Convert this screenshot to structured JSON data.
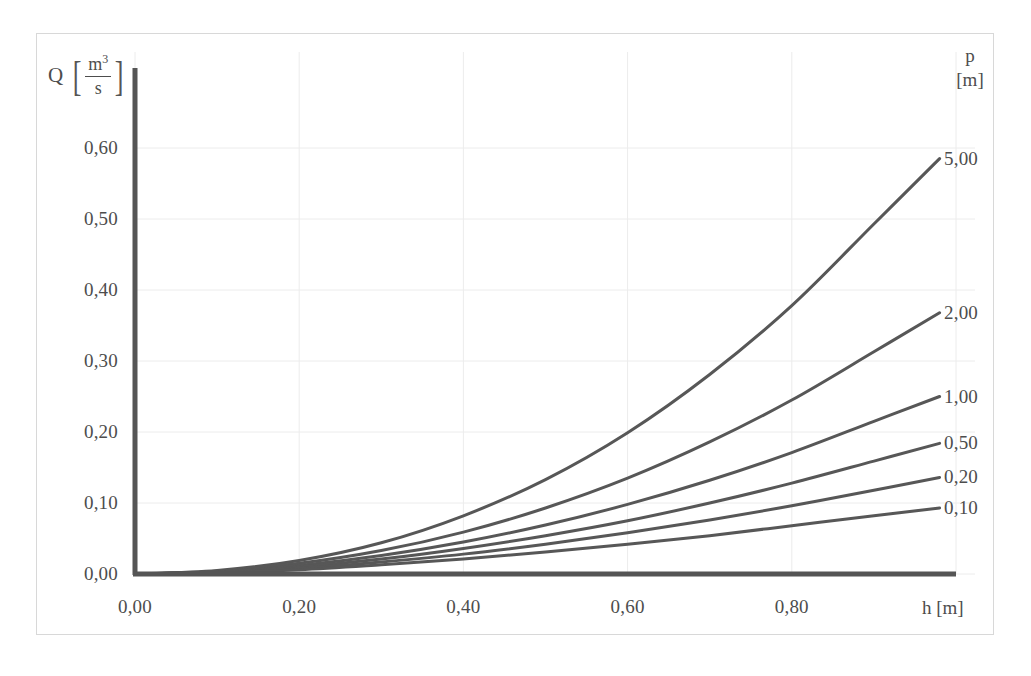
{
  "figure": {
    "axis_color": "#555555",
    "curve_color": "#575757",
    "grid_color": "#ececec",
    "frame_color": "#d8d8d8"
  },
  "y_axis": {
    "symbol": "Q",
    "bracket_open": "[",
    "bracket_close": "]",
    "unit_numerator": "m",
    "unit_numerator_exponent": "3",
    "unit_denominator": "s",
    "ticks": [
      "0,00",
      "0,10",
      "0,20",
      "0,30",
      "0,40",
      "0,50",
      "0,60"
    ]
  },
  "x_axis": {
    "title": "h [m]",
    "ticks": [
      "0,00",
      "0,20",
      "0,40",
      "0,60",
      "0,80"
    ]
  },
  "p_legend": {
    "symbol": "p",
    "unit": "[m]",
    "labels": [
      "5,00",
      "2,00",
      "1,00",
      "0,50",
      "0,20",
      "0,10"
    ]
  },
  "chart_data": {
    "type": "line",
    "title": "",
    "xlabel": "h [m]",
    "ylabel": "Q [m3/s]",
    "xlim": [
      0.0,
      1.0
    ],
    "ylim": [
      0.0,
      0.68
    ],
    "xticks": [
      0.0,
      0.2,
      0.4,
      0.6,
      0.8
    ],
    "yticks": [
      0.0,
      0.1,
      0.2,
      0.3,
      0.4,
      0.5,
      0.6
    ],
    "grid": true,
    "legend_position": "right",
    "legend_title": "p [m]",
    "x": [
      0.0,
      0.1,
      0.2,
      0.3,
      0.4,
      0.5,
      0.6,
      0.7,
      0.8,
      0.9,
      0.98
    ],
    "series": [
      {
        "name": "5,00",
        "values": [
          0.0,
          0.005,
          0.019,
          0.044,
          0.082,
          0.133,
          0.199,
          0.281,
          0.378,
          0.493,
          0.585
        ]
      },
      {
        "name": "2,00",
        "values": [
          0.0,
          0.004,
          0.015,
          0.033,
          0.059,
          0.093,
          0.135,
          0.186,
          0.245,
          0.313,
          0.368
        ]
      },
      {
        "name": "1,00",
        "values": [
          0.0,
          0.003,
          0.012,
          0.026,
          0.045,
          0.069,
          0.098,
          0.132,
          0.171,
          0.215,
          0.25
        ]
      },
      {
        "name": "0,50",
        "values": [
          0.0,
          0.003,
          0.01,
          0.021,
          0.036,
          0.054,
          0.075,
          0.1,
          0.128,
          0.159,
          0.184
        ]
      },
      {
        "name": "0,20",
        "values": [
          0.0,
          0.002,
          0.008,
          0.017,
          0.028,
          0.042,
          0.058,
          0.076,
          0.096,
          0.118,
          0.136
        ]
      },
      {
        "name": "0,10",
        "values": [
          0.0,
          0.002,
          0.006,
          0.013,
          0.021,
          0.031,
          0.042,
          0.054,
          0.068,
          0.082,
          0.093
        ]
      }
    ]
  }
}
